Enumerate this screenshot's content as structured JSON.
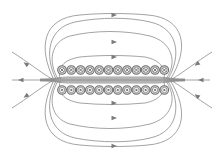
{
  "diagram": {
    "colors": {
      "background": "#ffffff",
      "field_line": "#8c8c8c",
      "coil_stroke": "#6e6e6e",
      "coil_fill": "#d9d9d9",
      "arrow": "#7a7a7a"
    },
    "coils": {
      "count_per_row": 12,
      "x_start": 62,
      "x_step": 9.3,
      "radius": 4.3,
      "top_row": {
        "y": 70,
        "symbol": "cross",
        "meaning": "current into page"
      },
      "bottom_row": {
        "y": 90,
        "symbol": "dot",
        "meaning": "current out of page"
      }
    },
    "field_direction": "left-to-right on outer top/bottom arcs; leftward along axis and at ends",
    "icons": {
      "coil_top": "cross-in-circle-icon",
      "coil_bottom": "dot-in-circle-icon",
      "arrow": "arrowhead-icon"
    }
  }
}
